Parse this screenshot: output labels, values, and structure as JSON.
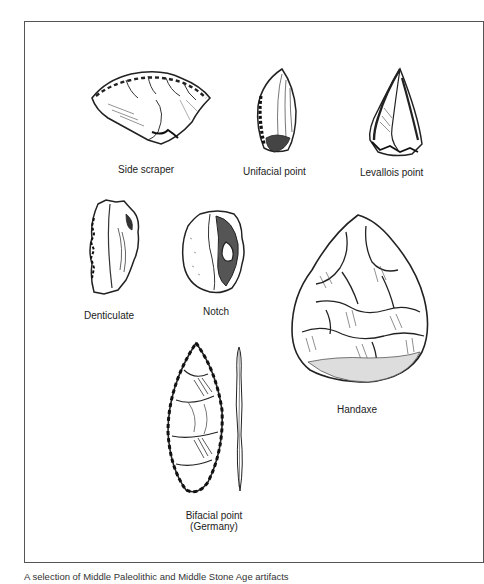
{
  "figure": {
    "caption": "A selection of Middle Paleolithic and Middle Stone Age artifacts",
    "artifacts": [
      {
        "id": "side-scraper",
        "label": "Side scraper"
      },
      {
        "id": "unifacial-point",
        "label": "Unifacial point"
      },
      {
        "id": "levallois-point",
        "label": "Levallois point"
      },
      {
        "id": "denticulate",
        "label": "Denticulate"
      },
      {
        "id": "notch",
        "label": "Notch"
      },
      {
        "id": "handaxe",
        "label": "Handaxe"
      },
      {
        "id": "bifacial-point",
        "label": "Bifacial point",
        "sublabel": "(Germany)"
      }
    ]
  }
}
